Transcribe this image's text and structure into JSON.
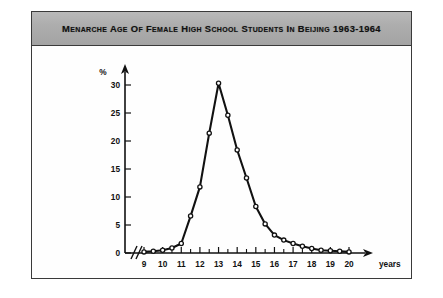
{
  "figure": {
    "title": "Menarche Age of Female High School Students in Beijing 1963-1964",
    "frame_color": "#3a3a3a",
    "banner_color": "#adadad"
  },
  "axes": {
    "y_unit_label": "%",
    "x_unit_label": "years",
    "y_ticks": [
      "0",
      "5",
      "10",
      "15",
      "20",
      "25",
      "30"
    ],
    "x_ticks": [
      "9",
      "10",
      "11",
      "12",
      "13",
      "14",
      "15",
      "16",
      "17",
      "18",
      "19",
      "20"
    ],
    "axis_break": "//"
  },
  "chart_data": {
    "type": "line",
    "title": "Menarche Age of Female High School Students in Beijing 1963-1964",
    "xlabel": "years",
    "ylabel": "%",
    "xlim": [
      8.75,
      20.5
    ],
    "ylim": [
      0,
      31.5
    ],
    "grid": false,
    "legend": "none",
    "marker": "open-circle",
    "x": [
      9.0,
      9.5,
      10.0,
      10.5,
      11.0,
      11.5,
      12.0,
      12.5,
      13.0,
      13.5,
      14.0,
      14.5,
      15.0,
      15.5,
      16.0,
      16.5,
      17.0,
      17.5,
      18.0,
      18.5,
      19.0,
      19.5,
      20.0
    ],
    "values": [
      0.2,
      0.3,
      0.5,
      0.9,
      1.7,
      6.6,
      11.8,
      21.4,
      30.3,
      24.6,
      18.4,
      13.4,
      8.3,
      5.2,
      3.2,
      2.3,
      1.7,
      1.2,
      0.8,
      0.5,
      0.4,
      0.3,
      0.2
    ],
    "y_ticks": [
      0,
      5,
      10,
      15,
      20,
      25,
      30
    ],
    "x_ticks": [
      9,
      10,
      11,
      12,
      13,
      14,
      15,
      16,
      17,
      18,
      19,
      20
    ]
  }
}
